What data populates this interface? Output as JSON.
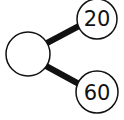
{
  "diagram": {
    "type": "tree",
    "root": {
      "label": ""
    },
    "children": [
      {
        "label": "20"
      },
      {
        "label": "60"
      }
    ],
    "colors": {
      "stroke": "#111111",
      "fill": "#ffffff"
    }
  }
}
